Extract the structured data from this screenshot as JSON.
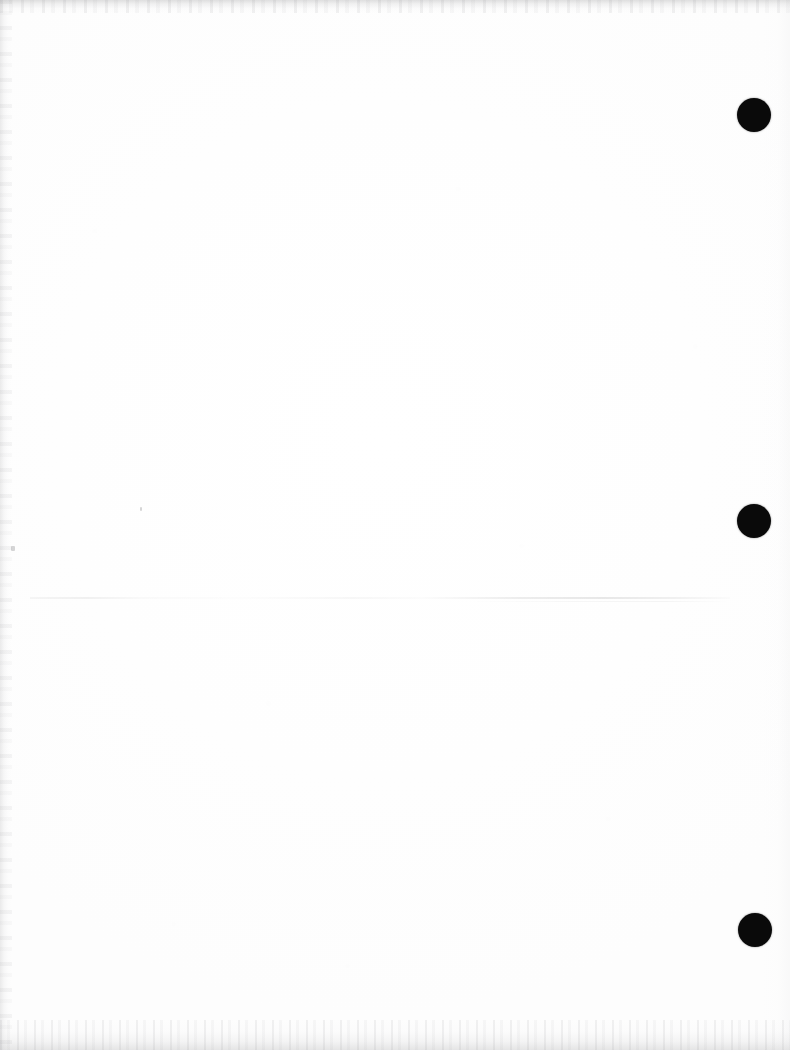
{
  "document": {
    "kind": "scanned-blank-page",
    "page_width_px": 790,
    "page_height_px": 1050,
    "background_color": "#fefefe",
    "visible_text": "",
    "body_text": "",
    "note": "Blank scanned sheet; no printed text, headings, numbers or captions are rendered in the pixels."
  },
  "marks": {
    "registration_dots": [
      {
        "name": "registration-dot-top",
        "cx": 754,
        "cy": 115,
        "r": 17,
        "color": "#0a0a0a"
      },
      {
        "name": "registration-dot-middle",
        "cx": 754,
        "cy": 521,
        "r": 17,
        "color": "#0a0a0a"
      },
      {
        "name": "registration-dot-bottom",
        "cx": 755,
        "cy": 930,
        "r": 17,
        "color": "#0a0a0a"
      }
    ],
    "scan_line": {
      "name": "faint-horizontal-scan-line",
      "x": 30,
      "y": 597,
      "width": 700,
      "height": 2,
      "color": "#000000",
      "opacity": "0.09"
    },
    "specks": [
      {
        "name": "speck-left-margin",
        "x": 11,
        "y": 546,
        "w": 4,
        "h": 5
      },
      {
        "name": "speck-upper-left",
        "x": 140,
        "y": 507,
        "w": 2,
        "h": 4
      }
    ]
  },
  "scan_artifacts": {
    "top_edge": {
      "name": "scanner-edge-top",
      "height_px": 13,
      "tone": "#9a9a9c"
    },
    "bottom_edge": {
      "name": "scanner-edge-bottom",
      "height_px": 30,
      "tone": "#9e9ea0"
    },
    "left_edge": {
      "name": "scanner-edge-left",
      "width_px": 12,
      "tone": "#b2b2b4"
    },
    "right_edge": {
      "name": "scanner-edge-right",
      "width_px": 28,
      "tone": "#e2e2e4"
    }
  }
}
